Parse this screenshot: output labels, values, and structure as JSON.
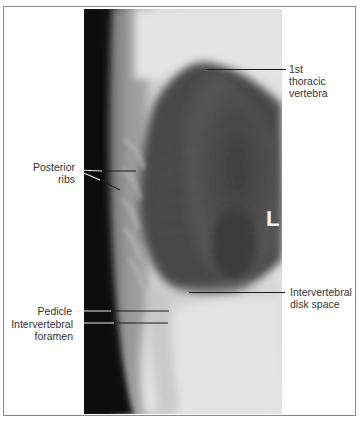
{
  "figure": {
    "type": "lateral chest radiograph, thoracic spine",
    "side_marker": "L",
    "labels": {
      "first_thoracic_vertebra": [
        "1st",
        "thoracic",
        "vertebra"
      ],
      "posterior_ribs": [
        "Posterior",
        "ribs"
      ],
      "intervertebral_disk_space": [
        "Intervertebral",
        "disk space"
      ],
      "pedicle": [
        "Pedicle"
      ],
      "intervertebral_foramen": [
        "Intervertebral",
        "foramen"
      ]
    }
  }
}
